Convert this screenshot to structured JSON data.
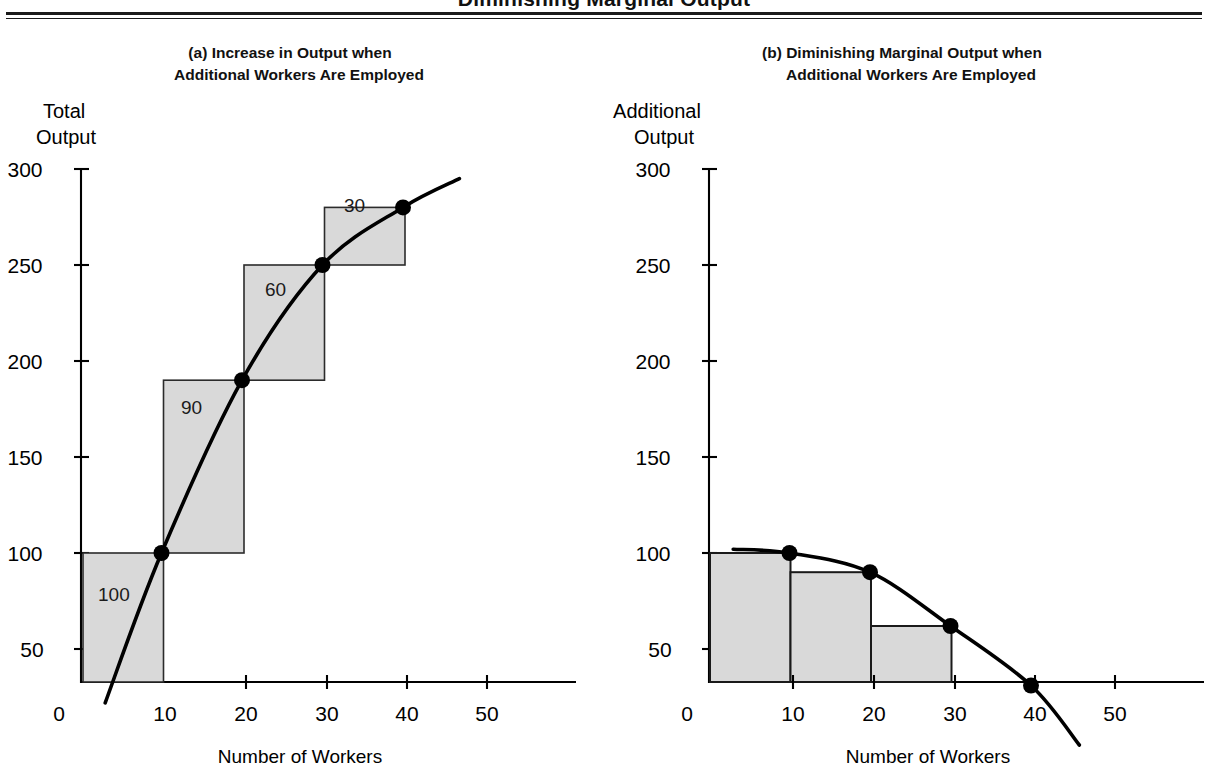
{
  "header": {
    "title": "Diminishing Marginal Output"
  },
  "panels": [
    {
      "tag": "(a)",
      "caption_line1": "Increase in Output when",
      "caption_line2": "Additional Workers Are Employed",
      "y_axis_name_line1": "Total",
      "y_axis_name_line2": "Output",
      "x_axis_title": "Number of Workers"
    },
    {
      "tag": "(b)",
      "caption_line1": "Diminishing Marginal Output when",
      "caption_line2": "Additional Workers Are Employed",
      "y_axis_name_line1": "Additional",
      "y_axis_name_line2": "Output",
      "x_axis_title": "Number of Workers"
    }
  ],
  "chart_data": [
    {
      "type": "line",
      "title": "(a) Increase in Output when Additional Workers Are Employed",
      "xlabel": "Number of Workers",
      "ylabel": "Total Output",
      "xlim": [
        0,
        57
      ],
      "ylim": [
        0,
        310
      ],
      "xticks": [
        "0",
        "10",
        "20",
        "30",
        "40",
        "50"
      ],
      "xtick_values": [
        0,
        10,
        20,
        30,
        40,
        50
      ],
      "yticks": [
        "50",
        "100",
        "150",
        "200",
        "250",
        "300"
      ],
      "ytick_values": [
        50,
        100,
        150,
        200,
        250,
        300
      ],
      "grid": false,
      "legend": "none",
      "series": [
        {
          "name": "Total output curve",
          "x": [
            3,
            10,
            20,
            30,
            40,
            47
          ],
          "y": [
            22,
            100,
            190,
            250,
            280,
            295
          ]
        }
      ],
      "points": [
        {
          "x": 10,
          "y": 100
        },
        {
          "x": 20,
          "y": 190
        },
        {
          "x": 30,
          "y": 250
        },
        {
          "x": 40,
          "y": 280
        }
      ],
      "step_boxes": [
        {
          "label": "100",
          "x_from": 0,
          "x_to": 10,
          "y_from": 0,
          "y_to": 100
        },
        {
          "label": "90",
          "x_from": 10,
          "x_to": 20,
          "y_from": 100,
          "y_to": 190
        },
        {
          "label": "60",
          "x_from": 20,
          "x_to": 30,
          "y_from": 190,
          "y_to": 250
        },
        {
          "label": "30",
          "x_from": 30,
          "x_to": 40,
          "y_from": 250,
          "y_to": 280
        }
      ]
    },
    {
      "type": "bar",
      "title": "(b) Diminishing Marginal Output when Additional Workers Are Employed",
      "xlabel": "Number of Workers",
      "ylabel": "Additional Output",
      "xlim": [
        0,
        57
      ],
      "ylim": [
        0,
        310
      ],
      "xticks": [
        "0",
        "10",
        "20",
        "30",
        "40",
        "50"
      ],
      "xtick_values": [
        0,
        10,
        20,
        30,
        40,
        50
      ],
      "yticks": [
        "50",
        "100",
        "150",
        "200",
        "250",
        "300"
      ],
      "ytick_values": [
        50,
        100,
        150,
        200,
        250,
        300
      ],
      "grid": false,
      "legend": "none",
      "categories": [
        "0-10",
        "10-20",
        "20-30",
        "30-40"
      ],
      "values": [
        100,
        90,
        62,
        31
      ],
      "bars": [
        {
          "x_from": 0,
          "x_to": 10,
          "height": 100
        },
        {
          "x_from": 10,
          "x_to": 20,
          "height": 90
        },
        {
          "x_from": 20,
          "x_to": 30,
          "height": 62
        },
        {
          "x_from": 30,
          "x_to": 40,
          "height": 31
        }
      ],
      "series": [
        {
          "name": "Marginal output curve",
          "x": [
            3,
            10,
            20,
            30,
            40,
            46
          ],
          "y": [
            102,
            100,
            90,
            62,
            31,
            0
          ]
        }
      ],
      "points": [
        {
          "x": 10,
          "y": 100
        },
        {
          "x": 20,
          "y": 90
        },
        {
          "x": 30,
          "y": 62
        },
        {
          "x": 40,
          "y": 31
        }
      ]
    }
  ]
}
